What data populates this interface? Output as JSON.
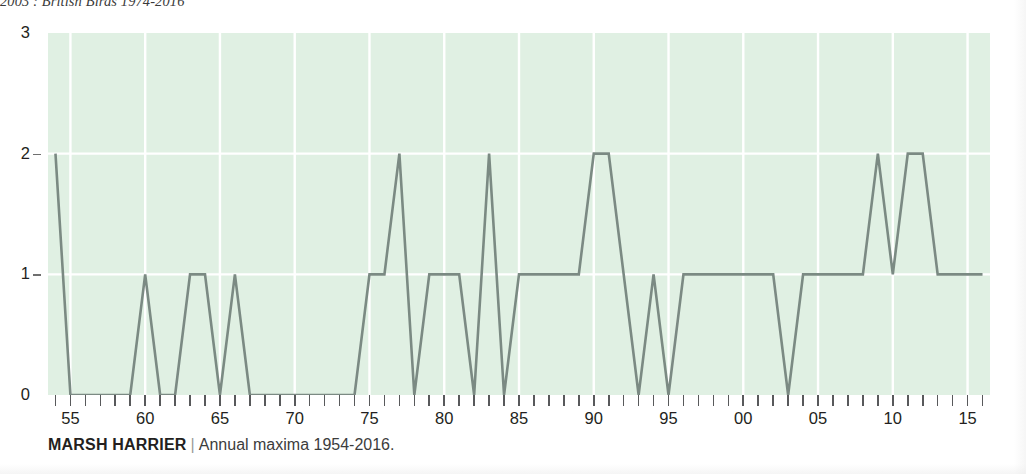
{
  "running_head": "2003 : British Birds 1974-2016",
  "caption": {
    "species": "MARSH HARRIER",
    "separator": "|",
    "subtitle": "Annual maxima 1954-2016."
  },
  "colors": {
    "plot_background": "#e0f0e3",
    "gridline": "#ffffff",
    "series_line": "#7b8a83",
    "tick": "#58595b",
    "text": "#231f20"
  },
  "chart_data": {
    "type": "line",
    "title": "MARSH HARRIER",
    "subtitle": "Annual maxima 1954-2016.",
    "xlabel": "",
    "ylabel": "",
    "xlim": [
      1953.5,
      2016.5
    ],
    "ylim": [
      0,
      3
    ],
    "grid": true,
    "legend": "none",
    "y_ticks": [
      0,
      1,
      2,
      3
    ],
    "y_tick_labels": [
      "0",
      "1",
      "2",
      "3"
    ],
    "x_ticks": [
      1955,
      1960,
      1965,
      1970,
      1975,
      1980,
      1985,
      1990,
      1995,
      2000,
      2005,
      2010,
      2015
    ],
    "x_tick_labels": [
      "55",
      "60",
      "65",
      "70",
      "75",
      "80",
      "85",
      "90",
      "95",
      "00",
      "05",
      "10",
      "15"
    ],
    "x_minor_tick_years": [
      1954,
      1955,
      1956,
      1957,
      1958,
      1959,
      1960,
      1961,
      1962,
      1963,
      1964,
      1965,
      1966,
      1967,
      1968,
      1969,
      1970,
      1971,
      1972,
      1973,
      1974,
      1975,
      1976,
      1977,
      1978,
      1979,
      1980,
      1981,
      1982,
      1983,
      1984,
      1985,
      1986,
      1987,
      1988,
      1989,
      1990,
      1991,
      1992,
      1993,
      1994,
      1995,
      1996,
      1997,
      1998,
      1999,
      2000,
      2001,
      2002,
      2003,
      2004,
      2005,
      2006,
      2007,
      2008,
      2009,
      2010,
      2011,
      2012,
      2013,
      2014,
      2015,
      2016
    ],
    "x": [
      1954,
      1955,
      1956,
      1957,
      1958,
      1959,
      1960,
      1961,
      1962,
      1963,
      1964,
      1965,
      1966,
      1967,
      1968,
      1969,
      1970,
      1971,
      1972,
      1973,
      1974,
      1975,
      1976,
      1977,
      1978,
      1979,
      1980,
      1981,
      1982,
      1983,
      1984,
      1985,
      1986,
      1987,
      1988,
      1989,
      1990,
      1991,
      1992,
      1993,
      1994,
      1995,
      1996,
      1997,
      1998,
      1999,
      2000,
      2001,
      2002,
      2003,
      2004,
      2005,
      2006,
      2007,
      2008,
      2009,
      2010,
      2011,
      2012,
      2013,
      2014,
      2015,
      2016
    ],
    "values": [
      2,
      0,
      0,
      0,
      0,
      0,
      1,
      0,
      0,
      1,
      1,
      0,
      1,
      0,
      0,
      0,
      0,
      0,
      0,
      0,
      0,
      1,
      1,
      2,
      0,
      1,
      1,
      1,
      0,
      2,
      0,
      1,
      1,
      1,
      1,
      1,
      2,
      2,
      1,
      0,
      1,
      0,
      1,
      1,
      1,
      1,
      1,
      1,
      1,
      0,
      1,
      1,
      1,
      1,
      1,
      2,
      1,
      2,
      2,
      1,
      1,
      1,
      1
    ],
    "series": [
      {
        "name": "Annual maxima",
        "values": [
          2,
          0,
          0,
          0,
          0,
          0,
          1,
          0,
          0,
          1,
          1,
          0,
          1,
          0,
          0,
          0,
          0,
          0,
          0,
          0,
          0,
          1,
          1,
          2,
          0,
          1,
          1,
          1,
          0,
          2,
          0,
          1,
          1,
          1,
          1,
          1,
          2,
          2,
          1,
          0,
          1,
          0,
          1,
          1,
          1,
          1,
          1,
          1,
          1,
          0,
          1,
          1,
          1,
          1,
          1,
          2,
          1,
          2,
          2,
          1,
          1,
          1,
          1
        ]
      }
    ]
  }
}
